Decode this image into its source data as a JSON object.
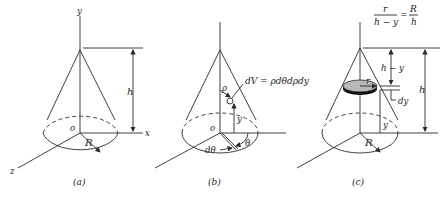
{
  "figure": {
    "panels": [
      {
        "id": "a",
        "caption": "(a)",
        "labels": {
          "y_axis": "y",
          "x_axis": "x",
          "z_axis": "z",
          "origin": "o",
          "height": "h",
          "radius": "R"
        }
      },
      {
        "id": "b",
        "caption": "(b)",
        "labels": {
          "rho": "ρ",
          "volume_element": "dV = ρdθdρdy",
          "y": "y",
          "origin": "o",
          "dtheta": "dθ",
          "theta": "θ"
        }
      },
      {
        "id": "c",
        "caption": "(c)",
        "labels": {
          "ratio_num_left": "r",
          "ratio_den_left": "h − y",
          "ratio_equals": "=",
          "ratio_num_right": "R",
          "ratio_den_right": "h",
          "h_minus_y": "h − y",
          "r": "r",
          "dy": "dy",
          "height": "h",
          "y": "y",
          "radius": "R"
        }
      }
    ],
    "colors": {
      "line": "#2a2a2a",
      "disc_fill": "#b8b8b8",
      "disc_rim": "#111111",
      "background": "#ffffff"
    }
  }
}
